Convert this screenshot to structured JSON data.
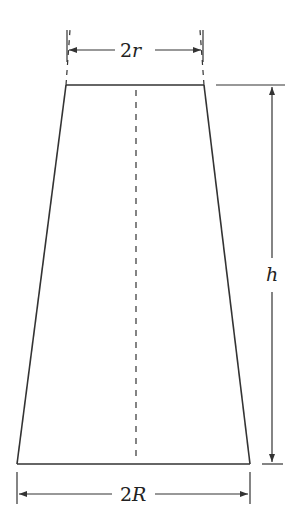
{
  "diagram": {
    "type": "truncated-cone-cross-section",
    "labels": {
      "top_width": {
        "prefix": "2",
        "var": "r"
      },
      "bottom_width": {
        "prefix": "2",
        "var": "R"
      },
      "height": {
        "var": "h"
      }
    },
    "colors": {
      "stroke": "#333333",
      "background": "#ffffff"
    }
  }
}
